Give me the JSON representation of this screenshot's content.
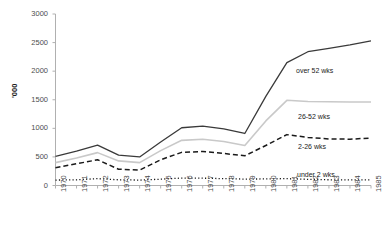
{
  "chart_data": {
    "type": "line",
    "title": "",
    "xlabel": "",
    "ylabel": "'000",
    "ylim": [
      0,
      3000
    ],
    "yticks": [
      0,
      500,
      1000,
      1500,
      2000,
      2500,
      3000
    ],
    "grid": false,
    "legend_position": "inline-right",
    "categories": [
      "1970",
      "1971",
      "1972",
      "1973",
      "1974",
      "1975",
      "1976",
      "1977",
      "1978",
      "1979",
      "1980",
      "1981",
      "1982",
      "1983",
      "1984",
      "1985"
    ],
    "series": [
      {
        "name": "over 52 wks",
        "style": "solid",
        "color": "#3a3a3a",
        "label_x": 296,
        "label_y": 67,
        "values": [
          510,
          600,
          705,
          530,
          500,
          760,
          1010,
          1040,
          990,
          910,
          1560,
          2150,
          2340,
          2400,
          2460,
          2530
        ]
      },
      {
        "name": "26-52 wks",
        "style": "solid",
        "color": "#c9c9c9",
        "label_x": 298,
        "label_y": 113,
        "values": [
          400,
          480,
          575,
          430,
          400,
          610,
          790,
          810,
          770,
          700,
          1130,
          1490,
          1470,
          1465,
          1460,
          1460
        ]
      },
      {
        "name": "2-26 wks",
        "style": "dashed",
        "color": "#1a1a1a",
        "label_x": 298,
        "label_y": 143,
        "values": [
          310,
          380,
          450,
          285,
          270,
          450,
          580,
          595,
          560,
          520,
          700,
          890,
          840,
          815,
          810,
          830
        ]
      },
      {
        "name": "under 2 wks",
        "style": "dotted",
        "color": "#1a1a1a",
        "label_x": 297,
        "label_y": 171,
        "values": [
          95,
          100,
          120,
          100,
          95,
          110,
          130,
          128,
          120,
          112,
          115,
          120,
          108,
          100,
          98,
          100
        ]
      }
    ]
  },
  "axes": {
    "y_title": "'000",
    "y_tick_labels": [
      "3000",
      "2500",
      "2000",
      "1500",
      "1000",
      "500",
      "0"
    ],
    "x_tick_labels": [
      "1970",
      "1971",
      "1972",
      "1973",
      "1974",
      "1975",
      "1976",
      "1977",
      "1978",
      "1979",
      "1980",
      "1981",
      "1982",
      "1983",
      "1984",
      "1985"
    ]
  }
}
